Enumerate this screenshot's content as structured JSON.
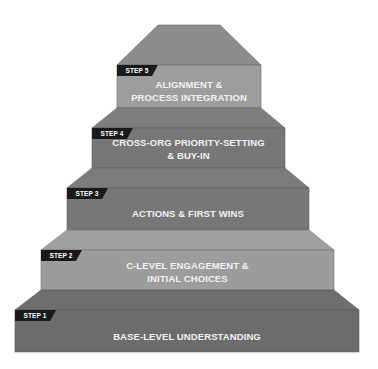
{
  "diagram": {
    "type": "staircase",
    "colors": {
      "tab_bg": "#1a1a1a",
      "text": "#f2f2f2"
    },
    "steps": [
      {
        "tab": "STEP 1",
        "line1": "BASE-LEVEL UNDERSTANDING",
        "line2": ""
      },
      {
        "tab": "STEP 2",
        "line1": "C-LEVEL ENGAGEMENT &",
        "line2": "INITIAL CHOICES"
      },
      {
        "tab": "STEP 3",
        "line1": "ACTIONS & FIRST WINS",
        "line2": ""
      },
      {
        "tab": "STEP 4",
        "line1": "CROSS-ORG PRIORITY-SETTING",
        "line2": "& BUY-IN"
      },
      {
        "tab": "STEP 5",
        "line1": "ALIGNMENT &",
        "line2": "PROCESS INTEGRATION"
      }
    ]
  }
}
